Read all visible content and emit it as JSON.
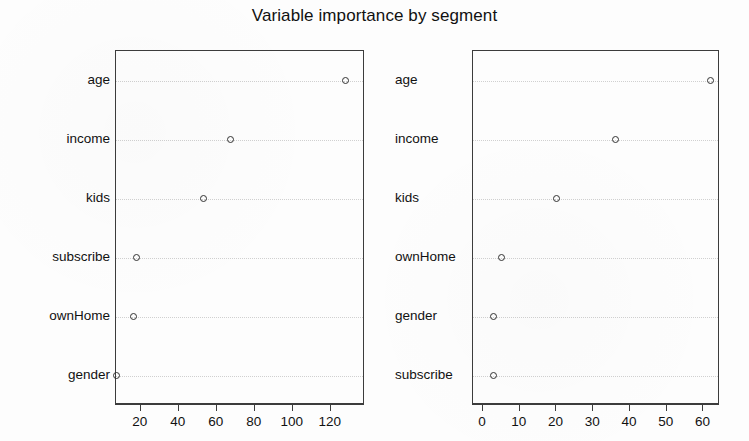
{
  "chart_data": {
    "type": "scatter",
    "title": "Variable importance by segment",
    "xlabel": "",
    "ylabel": "",
    "grid": true,
    "legend": "none",
    "panels": [
      {
        "name": "left-panel",
        "categories": [
          "age",
          "income",
          "kids",
          "subscribe",
          "ownHome",
          "gender"
        ],
        "values": [
          128,
          67,
          53,
          18,
          16,
          7
        ],
        "xlim": [
          7,
          138
        ],
        "xticks": [
          20,
          40,
          60,
          80,
          100,
          120
        ],
        "xticklabels": [
          "20",
          "40",
          "60",
          "80",
          "100",
          "120"
        ]
      },
      {
        "name": "right-panel",
        "categories": [
          "age",
          "income",
          "kids",
          "ownHome",
          "gender",
          "subscribe"
        ],
        "values": [
          62,
          36,
          20,
          5,
          3,
          3
        ],
        "xlim": [
          -2.7,
          64.5
        ],
        "xticks": [
          0,
          10,
          20,
          30,
          40,
          50,
          60
        ],
        "xticklabels": [
          "0",
          "10",
          "20",
          "30",
          "40",
          "50",
          "60"
        ]
      }
    ],
    "point_marker": "open-circle",
    "point_color": "#333333",
    "grid_color": "#c9c9c9",
    "axis_color": "#3c3c3c",
    "background": "#fdfdfd"
  }
}
